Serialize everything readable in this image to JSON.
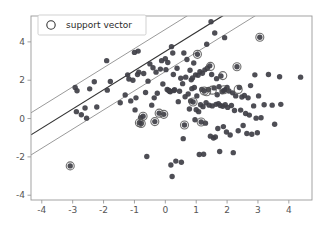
{
  "chart_data": {
    "type": "scatter",
    "title": "",
    "xlabel": "",
    "ylabel": "",
    "xlim": [
      -4.35,
      4.75
    ],
    "ylim": [
      -4.25,
      5.35
    ],
    "grid": false,
    "legend": {
      "position": "upper-left",
      "entries": [
        {
          "label": "support vector",
          "marker": "open-circle",
          "marker_color": "#333333"
        }
      ]
    },
    "xticks": [
      -4,
      -3,
      -2,
      -1,
      0,
      1,
      2,
      3,
      4
    ],
    "xticklabels": [
      "-4",
      "-3",
      "-2",
      "-1",
      "0",
      "1",
      "2",
      "3",
      "4"
    ],
    "yticks": [
      -4,
      -2,
      0,
      2,
      4
    ],
    "yticklabels": [
      "-4",
      "-2",
      "0",
      "2",
      "4"
    ],
    "colors": {
      "point": "#3f3f46",
      "support_vector_ring": "#555555",
      "decision_boundary": "#333333",
      "margin_line": "#9a9a9a",
      "axis": "#999999",
      "tick_text": "#555555",
      "legend_border": "#cccccc",
      "background": "#ffffff"
    },
    "lines": [
      {
        "name": "decision-boundary",
        "slope": 1.0,
        "intercept": 3.5,
        "color": "#333333",
        "width": 1.2
      },
      {
        "name": "margin-upper",
        "slope": 1.0,
        "intercept": 4.65,
        "color": "#9a9a9a",
        "width": 1.0
      },
      {
        "name": "margin-lower",
        "slope": 1.0,
        "intercept": 2.45,
        "color": "#9a9a9a",
        "width": 1.0
      }
    ],
    "series": [
      {
        "name": "samples",
        "marker": "filled-circle",
        "color": "#3f3f46",
        "points": [
          [
            -3.08,
            -2.47
          ],
          [
            -2.92,
            1.62
          ],
          [
            -2.88,
            0.36
          ],
          [
            -2.86,
            1.45
          ],
          [
            -2.72,
            0.2
          ],
          [
            -2.6,
            0.55
          ],
          [
            -2.55,
            0.02
          ],
          [
            -2.45,
            1.55
          ],
          [
            -2.3,
            1.92
          ],
          [
            -2.22,
            0.6
          ],
          [
            -1.9,
            3.02
          ],
          [
            -1.88,
            1.48
          ],
          [
            -1.78,
            1.93
          ],
          [
            -1.46,
            0.82
          ],
          [
            -1.3,
            1.23
          ],
          [
            -1.22,
            2.28
          ],
          [
            -1.18,
            2.06
          ],
          [
            -1.12,
            0.92
          ],
          [
            -1.05,
            2.0
          ],
          [
            -1.0,
            3.45
          ],
          [
            -0.98,
            0.45
          ],
          [
            -0.95,
            1.08
          ],
          [
            -0.9,
            2.3
          ],
          [
            -0.88,
            3.52
          ],
          [
            -0.86,
            2.42
          ],
          [
            -0.84,
            -0.22
          ],
          [
            -0.8,
            0.05
          ],
          [
            -0.78,
            -0.26
          ],
          [
            -0.72,
            0.12
          ],
          [
            -0.7,
            2.35
          ],
          [
            -0.64,
            1.36
          ],
          [
            -0.6,
            -1.98
          ],
          [
            -0.56,
            1.95
          ],
          [
            -0.5,
            2.85
          ],
          [
            -0.44,
            0.7
          ],
          [
            -0.4,
            2.65
          ],
          [
            -0.36,
            1.08
          ],
          [
            -0.34,
            -0.16
          ],
          [
            -0.3,
            2.42
          ],
          [
            -0.26,
            1.32
          ],
          [
            -0.2,
            0.28
          ],
          [
            -0.16,
            2.58
          ],
          [
            -0.12,
            3.02
          ],
          [
            -0.08,
            1.8
          ],
          [
            -0.05,
            0.22
          ],
          [
            0.0,
            3.12
          ],
          [
            0.02,
            2.55
          ],
          [
            0.06,
            1.52
          ],
          [
            0.08,
            2.92
          ],
          [
            0.1,
            1.48
          ],
          [
            0.12,
            1.45
          ],
          [
            0.14,
            1.42
          ],
          [
            0.16,
            1.4
          ],
          [
            0.18,
            -2.42
          ],
          [
            0.2,
            3.75
          ],
          [
            0.22,
            -3.02
          ],
          [
            0.24,
            3.42
          ],
          [
            0.26,
            2.3
          ],
          [
            0.28,
            1.46
          ],
          [
            0.3,
            1.5
          ],
          [
            0.34,
            -2.22
          ],
          [
            0.38,
            2.62
          ],
          [
            0.42,
            0.88
          ],
          [
            0.46,
            1.42
          ],
          [
            0.5,
            2.1
          ],
          [
            0.52,
            -2.28
          ],
          [
            0.56,
            1.82
          ],
          [
            0.58,
            -1.05
          ],
          [
            0.6,
            3.42
          ],
          [
            0.62,
            -0.34
          ],
          [
            0.64,
            1.14
          ],
          [
            0.66,
            2.16
          ],
          [
            0.7,
            3.08
          ],
          [
            0.74,
            1.28
          ],
          [
            0.78,
            0.5
          ],
          [
            0.8,
            2.52
          ],
          [
            0.82,
            0.92
          ],
          [
            0.84,
            2.02
          ],
          [
            0.86,
            1.56
          ],
          [
            0.88,
            2.12
          ],
          [
            0.9,
            0.86
          ],
          [
            0.92,
            2.9
          ],
          [
            0.94,
            1.62
          ],
          [
            0.96,
            -0.06
          ],
          [
            0.98,
            2.28
          ],
          [
            1.0,
            0.46
          ],
          [
            1.02,
            1.18
          ],
          [
            1.04,
            3.35
          ],
          [
            1.06,
            2.26
          ],
          [
            1.08,
            0.36
          ],
          [
            1.1,
            -1.88
          ],
          [
            1.12,
            2.44
          ],
          [
            1.14,
            0.72
          ],
          [
            1.16,
            -0.18
          ],
          [
            1.18,
            1.52
          ],
          [
            1.2,
            2.36
          ],
          [
            1.22,
            0.62
          ],
          [
            1.24,
            -1.86
          ],
          [
            1.26,
            1.44
          ],
          [
            1.28,
            2.54
          ],
          [
            1.3,
            -0.24
          ],
          [
            1.32,
            0.82
          ],
          [
            1.34,
            3.88
          ],
          [
            1.36,
            2.62
          ],
          [
            1.4,
            1.52
          ],
          [
            1.42,
            0.7
          ],
          [
            1.44,
            2.75
          ],
          [
            1.46,
            -0.92
          ],
          [
            1.48,
            5.05
          ],
          [
            1.5,
            2.3
          ],
          [
            1.52,
            0.66
          ],
          [
            1.56,
            -1.02
          ],
          [
            1.58,
            1.6
          ],
          [
            1.6,
            4.46
          ],
          [
            1.62,
            -0.96
          ],
          [
            1.64,
            0.74
          ],
          [
            1.66,
            2.08
          ],
          [
            1.68,
            1.24
          ],
          [
            1.7,
            -0.52
          ],
          [
            1.72,
            0.78
          ],
          [
            1.74,
            1.66
          ],
          [
            1.76,
            -1.72
          ],
          [
            1.78,
            0.68
          ],
          [
            1.8,
            2.22
          ],
          [
            1.84,
            1.4
          ],
          [
            1.86,
            0.64
          ],
          [
            1.88,
            -0.42
          ],
          [
            1.9,
            1.46
          ],
          [
            1.92,
            4.22
          ],
          [
            1.94,
            0.72
          ],
          [
            1.96,
            1.52
          ],
          [
            1.98,
            -0.7
          ],
          [
            2.0,
            1.62
          ],
          [
            2.02,
            0.58
          ],
          [
            2.06,
            1.44
          ],
          [
            2.1,
            -0.86
          ],
          [
            2.14,
            0.68
          ],
          [
            2.18,
            1.34
          ],
          [
            2.2,
            -1.78
          ],
          [
            2.24,
            0.42
          ],
          [
            2.28,
            1.18
          ],
          [
            2.32,
            2.7
          ],
          [
            2.36,
            -0.64
          ],
          [
            2.4,
            1.62
          ],
          [
            2.44,
            0.44
          ],
          [
            2.48,
            1.12
          ],
          [
            2.52,
            -0.36
          ],
          [
            2.56,
            1.2
          ],
          [
            2.6,
            0.26
          ],
          [
            2.64,
            -0.78
          ],
          [
            2.68,
            1.08
          ],
          [
            2.72,
            0.18
          ],
          [
            2.76,
            1.72
          ],
          [
            2.8,
            -0.82
          ],
          [
            2.86,
            0.66
          ],
          [
            2.9,
            2.28
          ],
          [
            2.94,
            0.02
          ],
          [
            2.98,
            -0.74
          ],
          [
            3.02,
            1.18
          ],
          [
            3.06,
            4.24
          ],
          [
            3.1,
            0.04
          ],
          [
            3.2,
            0.72
          ],
          [
            3.34,
            2.3
          ],
          [
            3.46,
            0.7
          ],
          [
            3.54,
            -0.3
          ],
          [
            3.7,
            2.18
          ],
          [
            3.74,
            0.74
          ],
          [
            4.38,
            2.16
          ]
        ]
      },
      {
        "name": "support-vectors",
        "marker": "ringed-circle",
        "color": "#3f3f46",
        "ring_color": "#555555",
        "points": [
          [
            -3.08,
            -2.47
          ],
          [
            -0.84,
            -0.22
          ],
          [
            -0.78,
            -0.26
          ],
          [
            -0.72,
            0.12
          ],
          [
            -0.34,
            -0.16
          ],
          [
            -0.2,
            0.28
          ],
          [
            -0.05,
            0.22
          ],
          [
            0.62,
            -0.34
          ],
          [
            0.9,
            0.86
          ],
          [
            1.04,
            3.35
          ],
          [
            1.16,
            -0.18
          ],
          [
            1.26,
            1.44
          ],
          [
            1.34,
            1.4
          ],
          [
            1.46,
            2.72
          ],
          [
            1.52,
            1.48
          ],
          [
            1.86,
            2.24
          ],
          [
            1.9,
            1.5
          ],
          [
            2.32,
            2.7
          ],
          [
            2.36,
            1.52
          ],
          [
            3.06,
            4.24
          ]
        ]
      }
    ]
  },
  "axes": {
    "legend_text": "support vector"
  }
}
